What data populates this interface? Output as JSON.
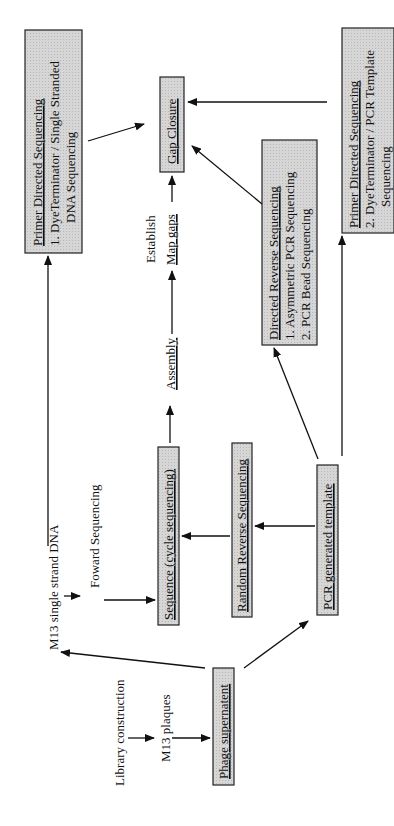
{
  "diagram": {
    "nodes": {
      "library_construction": "Library construction",
      "m13_plaques": "M13 plaques",
      "phage_supernatent": "Phage supernatent",
      "m13_single_strand": "M13 single strand DNA",
      "foward_sequencing": "Foward Sequencing",
      "sequence_cycle": "Sequence (cycle sequencing)",
      "random_reverse": "Random Reverse Sequencing",
      "pcr_template": "PCR generated template",
      "assembly": "Assembly",
      "establish": "Establish",
      "map_gaps": "Map gaps",
      "gap_closure": "Gap Closure",
      "primer_directed_ss": {
        "title": "Primer Directed Sequencing",
        "line1": "1.  DyeTerminator / Single Stranded",
        "line2": "DNA Sequencing"
      },
      "directed_reverse": {
        "title": "Directed Reverse Sequencing",
        "line1": "1.  Asymmetric PCR Sequencing",
        "line2": "2.  PCR Bead Sequencing"
      },
      "primer_directed_pcr": {
        "title": "Primer Directed Sequencing",
        "line1": "2.  DyeTerminator / PCR Template",
        "line2": "Sequencing"
      }
    },
    "colors": {
      "box_fill": "#d4d4d4",
      "stroke": "#111111"
    }
  }
}
